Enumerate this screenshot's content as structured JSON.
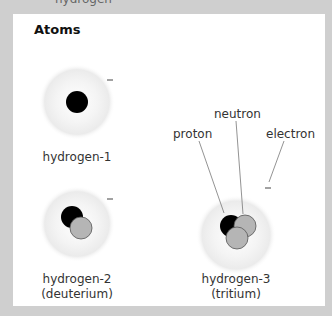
{
  "header_fragment": "hydrogen",
  "figure": {
    "title": "Atoms",
    "atoms": [
      {
        "name": "hydrogen-1",
        "subtitle": "",
        "protons": 1,
        "neutrons": 0,
        "electron_symbol": "−"
      },
      {
        "name": "hydrogen-2",
        "subtitle": "(deuterium)",
        "protons": 1,
        "neutrons": 1,
        "electron_symbol": "−"
      },
      {
        "name": "hydrogen-3",
        "subtitle": "(tritium)",
        "protons": 1,
        "neutrons": 2,
        "electron_symbol": "−"
      }
    ],
    "part_labels": {
      "proton": "proton",
      "neutron": "neutron",
      "electron": "electron"
    },
    "colors": {
      "proton": "#000000",
      "neutron": "#b5b5b5",
      "cloud": "#ececec",
      "background": "#cfcfcf",
      "panel": "#ffffff"
    }
  }
}
